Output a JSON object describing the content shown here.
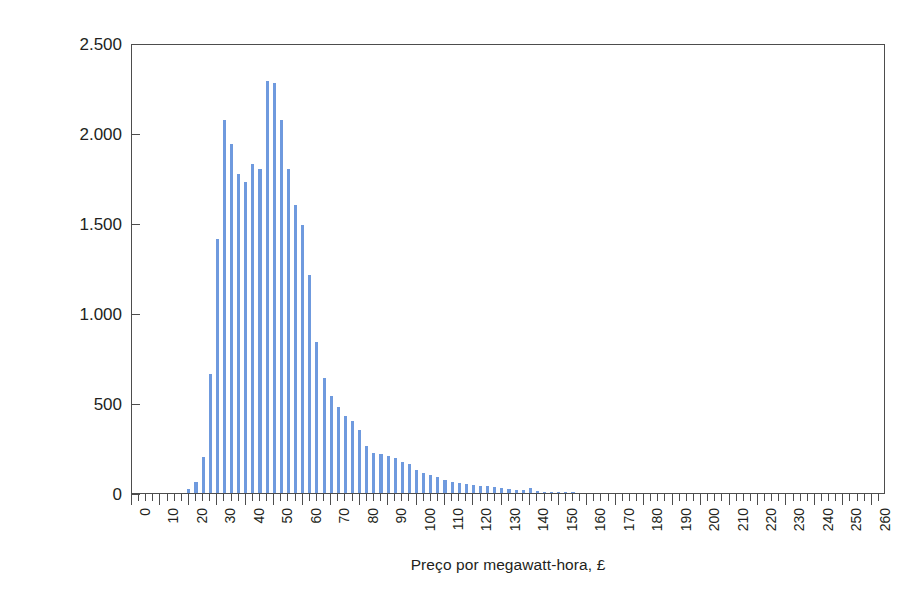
{
  "chart_data": {
    "type": "bar",
    "title": "",
    "subtitle": "",
    "xlabel": "Preço por megawatt-hora, £",
    "ylabel": "Número de períodos de meia hora",
    "xlim": [
      0,
      265
    ],
    "ylim": [
      0,
      2500
    ],
    "grid": false,
    "legend": null,
    "bar_color": "#6f9ade",
    "axis_color": "#4d4d4d",
    "text_color": "#231f20",
    "bin_width": 2.5,
    "x_tick_step_minor": 2.5,
    "x_tick_step_major": 10,
    "y_ticks": [
      0,
      500,
      1000,
      1500,
      2000,
      2500
    ],
    "y_tick_labels": [
      "0",
      "500",
      "1.000",
      "1.500",
      "2.000",
      "2.500"
    ],
    "x_ticks": [
      0,
      10,
      20,
      30,
      40,
      50,
      60,
      70,
      80,
      90,
      100,
      110,
      120,
      130,
      140,
      150,
      160,
      170,
      180,
      190,
      200,
      210,
      220,
      230,
      240,
      250,
      260
    ],
    "x_tick_labels": [
      "0",
      "10",
      "20",
      "30",
      "40",
      "50",
      "60",
      "70",
      "80",
      "90",
      "100",
      "110",
      "120",
      "130",
      "140",
      "150",
      "160",
      "170",
      "180",
      "190",
      "200",
      "210",
      "220",
      "230",
      "240",
      "250",
      "260"
    ],
    "categories": [
      20,
      22.5,
      25,
      27.5,
      30,
      32.5,
      35,
      37.5,
      40,
      42.5,
      45,
      47.5,
      50,
      52.5,
      55,
      57.5,
      60,
      62.5,
      65,
      67.5,
      70,
      72.5,
      75,
      77.5,
      80,
      82.5,
      85,
      87.5,
      90,
      92.5,
      95,
      97.5,
      100,
      102.5,
      105,
      107.5,
      110,
      112.5,
      115,
      117.5,
      120,
      122.5,
      125,
      127.5,
      130,
      132.5,
      135,
      137.5,
      140,
      142.5,
      145,
      147.5,
      150,
      152.5,
      155
    ],
    "values": [
      20,
      60,
      200,
      660,
      1410,
      2070,
      1940,
      1770,
      1730,
      1830,
      1800,
      2290,
      2280,
      2070,
      1800,
      1600,
      1490,
      1210,
      840,
      640,
      540,
      480,
      430,
      400,
      350,
      260,
      220,
      215,
      205,
      195,
      170,
      160,
      130,
      110,
      100,
      90,
      75,
      60,
      55,
      50,
      45,
      40,
      38,
      32,
      28,
      22,
      18,
      14,
      30,
      10,
      8,
      6,
      5,
      4,
      3
    ]
  }
}
